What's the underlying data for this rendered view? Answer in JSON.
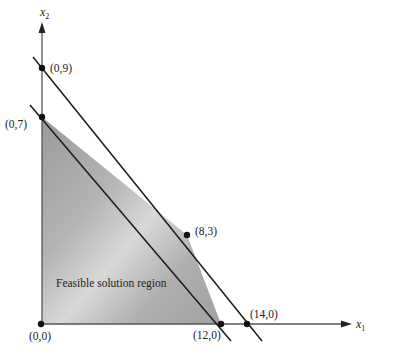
{
  "diagram": {
    "type": "linear-programming-feasible-region",
    "axes": {
      "x_label": "x",
      "x_subscript": "1",
      "y_label": "x",
      "y_subscript": "2"
    },
    "points": [
      {
        "id": "origin",
        "label": "(0,0)",
        "x": 0,
        "y": 0
      },
      {
        "id": "p09",
        "label": "(0,9)",
        "x": 0,
        "y": 9
      },
      {
        "id": "p07",
        "label": "(0,7)",
        "x": 0,
        "y": 7
      },
      {
        "id": "p83",
        "label": "(8,3)",
        "x": 8,
        "y": 3
      },
      {
        "id": "p120",
        "label": "(12,0)",
        "x": 12,
        "y": 0
      },
      {
        "id": "p140",
        "label": "(14,0)",
        "x": 14,
        "y": 0
      }
    ],
    "constraint_lines": [
      {
        "id": "line-1",
        "through": [
          "(0,9)",
          "(14,0)"
        ]
      },
      {
        "id": "line-2",
        "through": [
          "(0,7)",
          "(12,0)"
        ]
      }
    ],
    "region": {
      "label": "Feasible solution region",
      "vertices": [
        "(0,0)",
        "(0,7)",
        "(8,3)",
        "(12,0)"
      ],
      "fill_color": "#b8b8b8"
    },
    "colors": {
      "line": "#1a1a1a",
      "axis": "#555555",
      "point": "#111111"
    }
  }
}
